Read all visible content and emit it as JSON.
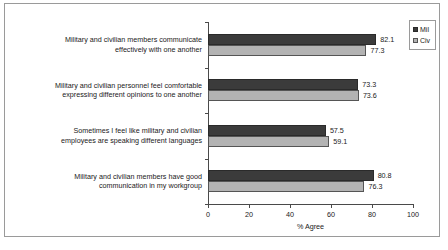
{
  "chart_data": {
    "type": "bar",
    "orientation": "horizontal",
    "title": "",
    "xlabel": "% Agree",
    "ylabel": "",
    "xlim": [
      0,
      100
    ],
    "xticks": [
      0,
      20,
      40,
      60,
      80,
      100
    ],
    "grid": false,
    "legend_position": "top-right",
    "categories": [
      "Military and civilian members communicate\neffectively with one another",
      "Military and civilian personnel feel comfortable\nexpressing different opinions to one another",
      "Sometimes I feel like military and civilian\nemployees are speaking different languages",
      "Military and civilian members have good\ncommunication in my workgroup"
    ],
    "series": [
      {
        "name": "Mil",
        "color": "#3b3b3b",
        "values": [
          82.1,
          73.3,
          57.5,
          80.8
        ]
      },
      {
        "name": "Civ",
        "color": "#b3b3b3",
        "values": [
          77.3,
          73.6,
          59.1,
          76.3
        ]
      }
    ],
    "value_labels": [
      [
        "82.1",
        "73.3",
        "57.5",
        "80.8"
      ],
      [
        "77.3",
        "73.6",
        "59.1",
        "76.3"
      ]
    ],
    "xtick_labels": [
      "0",
      "20",
      "40",
      "60",
      "80",
      "100"
    ]
  }
}
